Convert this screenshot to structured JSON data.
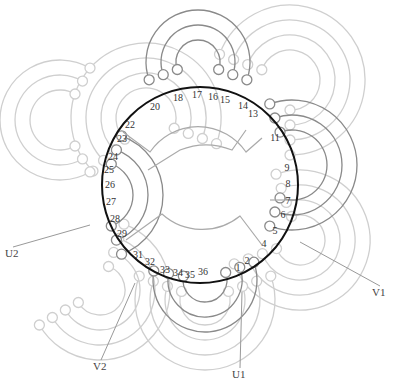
{
  "diagram": {
    "type": "stator-winding-diagram",
    "slot_count": 36,
    "center": [
      200,
      185
    ],
    "stator_radius": 98,
    "colors": {
      "stator": "#111111",
      "phase_active": "#8a8a8a",
      "phase_faint": "#cfcfcf",
      "text": "#333333"
    },
    "slot_labels": [
      {
        "n": "1",
        "x": 238,
        "y": 271
      },
      {
        "n": "2",
        "x": 247,
        "y": 264
      },
      {
        "n": "4",
        "x": 264,
        "y": 247
      },
      {
        "n": "5",
        "x": 275,
        "y": 234
      },
      {
        "n": "6",
        "x": 283,
        "y": 218
      },
      {
        "n": "7",
        "x": 288,
        "y": 204
      },
      {
        "n": "8",
        "x": 288,
        "y": 187
      },
      {
        "n": "9",
        "x": 287,
        "y": 171
      },
      {
        "n": "11",
        "x": 275,
        "y": 141
      },
      {
        "n": "13",
        "x": 253,
        "y": 117
      },
      {
        "n": "14",
        "x": 243,
        "y": 109
      },
      {
        "n": "15",
        "x": 225,
        "y": 103
      },
      {
        "n": "16",
        "x": 213,
        "y": 100
      },
      {
        "n": "17",
        "x": 197,
        "y": 98
      },
      {
        "n": "18",
        "x": 178,
        "y": 101
      },
      {
        "n": "20",
        "x": 155,
        "y": 110
      },
      {
        "n": "22",
        "x": 130,
        "y": 128
      },
      {
        "n": "23",
        "x": 122,
        "y": 142
      },
      {
        "n": "24",
        "x": 113,
        "y": 160
      },
      {
        "n": "25",
        "x": 109,
        "y": 173
      },
      {
        "n": "26",
        "x": 110,
        "y": 188
      },
      {
        "n": "27",
        "x": 111,
        "y": 205
      },
      {
        "n": "28",
        "x": 115,
        "y": 222
      },
      {
        "n": "29",
        "x": 122,
        "y": 237
      },
      {
        "n": "31",
        "x": 138,
        "y": 258
      },
      {
        "n": "32",
        "x": 150,
        "y": 265
      },
      {
        "n": "33",
        "x": 165,
        "y": 273
      },
      {
        "n": "34",
        "x": 178,
        "y": 276
      },
      {
        "n": "35",
        "x": 190,
        "y": 278
      },
      {
        "n": "36",
        "x": 203,
        "y": 275
      }
    ],
    "terminals": [
      {
        "label": "U1",
        "x": 232,
        "y": 378,
        "from": [
          242,
          292
        ]
      },
      {
        "label": "U2",
        "x": 5,
        "y": 257,
        "from": [
          90,
          225
        ]
      },
      {
        "label": "V1",
        "x": 372,
        "y": 296,
        "from": [
          300,
          242
        ]
      },
      {
        "label": "V2",
        "x": 93,
        "y": 370,
        "from": [
          135,
          283
        ]
      }
    ]
  }
}
